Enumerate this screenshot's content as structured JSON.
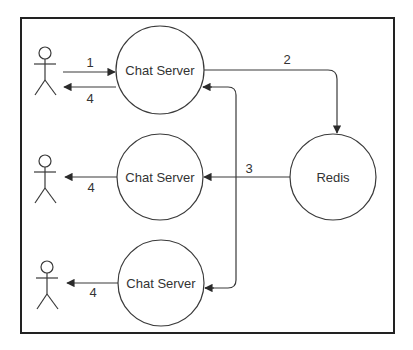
{
  "diagram": {
    "colors": {
      "stroke": "#3a3a3a",
      "frame": "#222222",
      "text": "#333333",
      "background": "#ffffff"
    },
    "nodes": {
      "server1": {
        "label": "Chat Server"
      },
      "server2": {
        "label": "Chat Server"
      },
      "server3": {
        "label": "Chat Server"
      },
      "redis": {
        "label": "Redis"
      }
    },
    "actors": [
      {
        "name": "user-1"
      },
      {
        "name": "user-2"
      },
      {
        "name": "user-3"
      }
    ],
    "edges": [
      {
        "from": "user-1",
        "to": "server1",
        "label": "1"
      },
      {
        "from": "server1",
        "to": "user-1",
        "label": "4"
      },
      {
        "from": "server1",
        "to": "redis",
        "label": "2"
      },
      {
        "from": "redis",
        "to": "server2",
        "label": "3"
      },
      {
        "from": "redis",
        "to": "server1",
        "label": ""
      },
      {
        "from": "redis",
        "to": "server3",
        "label": ""
      },
      {
        "from": "server2",
        "to": "user-2",
        "label": "4"
      },
      {
        "from": "server3",
        "to": "user-3",
        "label": "4"
      }
    ]
  }
}
